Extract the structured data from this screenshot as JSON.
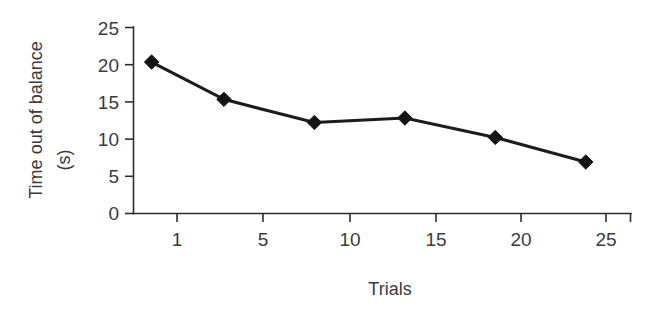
{
  "chart_data": {
    "type": "line",
    "title": "",
    "subtitle": "",
    "xlabel": "Trials",
    "ylabel": "Time out of balance (s)",
    "ylabel_line1": "Time out of balance",
    "ylabel_line2": "(s)",
    "x": [
      1,
      5,
      10,
      15,
      20,
      25
    ],
    "categories": [
      "1",
      "5",
      "10",
      "15",
      "20",
      "25"
    ],
    "values": [
      20.3,
      15.3,
      12.2,
      12.8,
      10.2,
      6.9
    ],
    "series": [
      {
        "name": "Time out of balance",
        "values": [
          20.3,
          15.3,
          12.2,
          12.8,
          10.2,
          6.9
        ],
        "marker": "diamond",
        "color": "#141414"
      }
    ],
    "xlim": [
      0,
      27.5
    ],
    "ylim": [
      0,
      25
    ],
    "xticks": [
      1,
      5,
      10,
      15,
      20,
      25
    ],
    "xtick_labels": [
      "1",
      "5",
      "10",
      "15",
      "20",
      "25"
    ],
    "yticks": [
      0,
      5,
      10,
      15,
      20,
      25
    ],
    "ytick_labels": [
      "0",
      "5",
      "10",
      "15",
      "20",
      "25"
    ],
    "grid": false,
    "legend": false,
    "legend_position": "none",
    "line_color": "#1c1c1c",
    "axis_color": "#2e2e2e",
    "background": "#ffffff"
  }
}
